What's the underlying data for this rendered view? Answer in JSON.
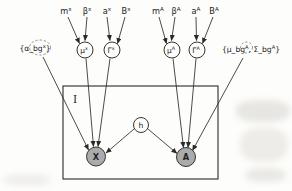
{
  "colors": {
    "background": "#fdfdfb",
    "ink": "#1b1b1b",
    "shaded_node_fill": "#ababab",
    "plain_node_fill": "#fdfdfb"
  },
  "plate": {
    "label": "I"
  },
  "left": {
    "params": [
      {
        "base": "m",
        "sup": "x"
      },
      {
        "base": "β",
        "sup": "x"
      },
      {
        "base": "a",
        "sup": "x"
      },
      {
        "base": "B",
        "sup": "x"
      }
    ],
    "mu_node": {
      "base": "μ",
      "sup": "x"
    },
    "gamma_node": {
      "base": "Γ",
      "sup": "x"
    },
    "bg_label": {
      "pre": "{α_bg",
      "sup": "x",
      "post": "}"
    }
  },
  "right": {
    "params": [
      {
        "base": "m",
        "sup": "A"
      },
      {
        "base": "β",
        "sup": "A"
      },
      {
        "base": "a",
        "sup": "A"
      },
      {
        "base": "B",
        "sup": "A"
      }
    ],
    "mu_node": {
      "base": "μ",
      "sup": "A"
    },
    "gamma_node": {
      "base": "Γ",
      "sup": "A"
    },
    "bg_label": {
      "pre": "{μ_bg",
      "sup1": "A",
      "mid": ", Σ_bg",
      "sup2": "A",
      "post": "}"
    }
  },
  "nodes": {
    "h": "h",
    "X": "X",
    "A": "A"
  }
}
